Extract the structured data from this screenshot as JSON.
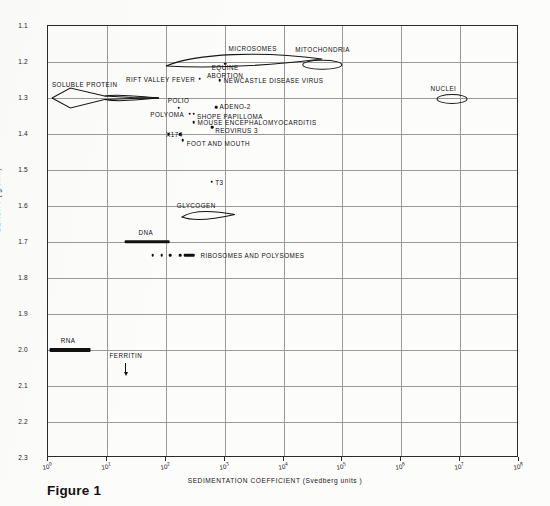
{
  "figure": {
    "caption": "Figure 1"
  },
  "chart_data": {
    "type": "scatter",
    "title": "",
    "xlabel": "SEDIMENTATION  COEFFICIENT  (Svedberg units )",
    "ylabel": "DENSITY ( g/cm3 )",
    "xscale": "log",
    "xlim": [
      1,
      100000000
    ],
    "ylim": [
      1.1,
      2.3
    ],
    "yaxis_inverted": true,
    "grid": true,
    "legend": "none",
    "xticks": [
      {
        "label": "10",
        "exp": "0",
        "value": 1
      },
      {
        "label": "10",
        "exp": "1",
        "value": 10
      },
      {
        "label": "10",
        "exp": "2",
        "value": 100
      },
      {
        "label": "10",
        "exp": "3",
        "value": 1000
      },
      {
        "label": "10",
        "exp": "4",
        "value": 10000
      },
      {
        "label": "10",
        "exp": "5",
        "value": 100000
      },
      {
        "label": "10",
        "exp": "6",
        "value": 1000000
      },
      {
        "label": "10",
        "exp": "7",
        "value": 10000000
      },
      {
        "label": "10",
        "exp": "8",
        "value": 100000000
      }
    ],
    "yticks": [
      "1.1",
      "1.2",
      "1.3",
      "1.4",
      "1.5",
      "1.6",
      "1.7",
      "1.8",
      "1.9",
      "2.0",
      "2.1",
      "2.2",
      "2.3"
    ],
    "points": [
      {
        "name": "RIFT VALLEY FEVER",
        "s": 380,
        "density": 1.245,
        "label_side": "right"
      },
      {
        "name": "EQUINE ABORTION",
        "s": 1000,
        "density": 1.218,
        "label_side": "below"
      },
      {
        "name": "NEWCASTLE DISEASE VIRUS",
        "s": 900,
        "density": 1.248,
        "label_side": "left"
      },
      {
        "name": "POLIO",
        "s": 160,
        "density": 1.325,
        "label_side": "above"
      },
      {
        "name": "ADENO-2",
        "s": 750,
        "density": 1.327,
        "label_side": "right"
      },
      {
        "name": "POLYOMA",
        "s": 240,
        "density": 1.343,
        "label_side": "right"
      },
      {
        "name": "SHOPE PAPILLOMA",
        "s": 290,
        "density": 1.343,
        "label_side": "right"
      },
      {
        "name": "MOUSE ENCEPHALOMYOCARDITIS",
        "s": 300,
        "density": 1.368,
        "label_side": "right"
      },
      {
        "name": "REOVIRUS 3",
        "s": 640,
        "density": 1.385,
        "label_side": "right"
      },
      {
        "name": "X174",
        "s": 115,
        "density": 1.4,
        "label_side": "both"
      },
      {
        "name": "FOOT AND MOUTH",
        "s": 200,
        "density": 1.425,
        "label_side": "right"
      },
      {
        "name": "T3",
        "s": 620,
        "density": 1.532,
        "label_side": "right"
      }
    ],
    "regions": [
      {
        "name": "MICROSOMES",
        "shape": "ellipse",
        "s_range": [
          100,
          40000
        ],
        "density": 1.2
      },
      {
        "name": "MITOCHONDRIA",
        "shape": "ellipse",
        "s_range": [
          20000,
          90000
        ],
        "density": 1.205
      },
      {
        "name": "NUCLEI",
        "shape": "ellipse",
        "s_range": [
          4000000,
          13000000
        ],
        "density": 1.3
      },
      {
        "name": "SOLUBLE PROTEIN",
        "shape": "lens",
        "s_range": [
          1.2,
          70
        ],
        "density": 1.3
      },
      {
        "name": "GLYCOGEN",
        "shape": "ellipse",
        "s_range": [
          200,
          1400
        ],
        "density": 1.625
      },
      {
        "name": "DNA",
        "shape": "bar",
        "s_range": [
          20,
          110
        ],
        "density": 1.7
      },
      {
        "name": "RIBOSOMES AND POLYSOMES",
        "shape": "dots",
        "s_range": [
          60,
          300
        ],
        "density": 1.735
      },
      {
        "name": "RNA",
        "shape": "bar",
        "s_range": [
          1.1,
          5
        ],
        "density": 2.0
      },
      {
        "name": "FERRITIN",
        "shape": "arrow",
        "s": 20,
        "density": 2.03
      }
    ]
  },
  "labels": {
    "microsomes": "MICROSOMES",
    "mitochondria": "MITOCHONDRIA",
    "nuclei": "NUCLEI",
    "soluble_protein": "SOLUBLE PROTEIN",
    "glycogen": "GLYCOGEN",
    "dna": "DNA",
    "rna": "RNA",
    "ferritin": "FERRITIN",
    "ribosomes": "RIBOSOMES  AND  POLYSOMES",
    "rift_valley": "RIFT VALLEY FEVER",
    "equine_line1": "EQUINE",
    "equine_line2": "ABORTION",
    "newcastle": "NEWCASTLE  DISEASE  VIRUS",
    "polio": "POLIO",
    "adeno2": "ADENO-2",
    "polyoma": "POLYOMA",
    "shope": "SHOPE  PAPILLOMA",
    "mouse_enceph": "MOUSE  ENCEPHALOMYOCARDITIS",
    "reovirus": "REOVIRUS 3",
    "x174": "X174",
    "foot_mouth": "FOOT  AND  MOUTH",
    "t3": "T3"
  }
}
